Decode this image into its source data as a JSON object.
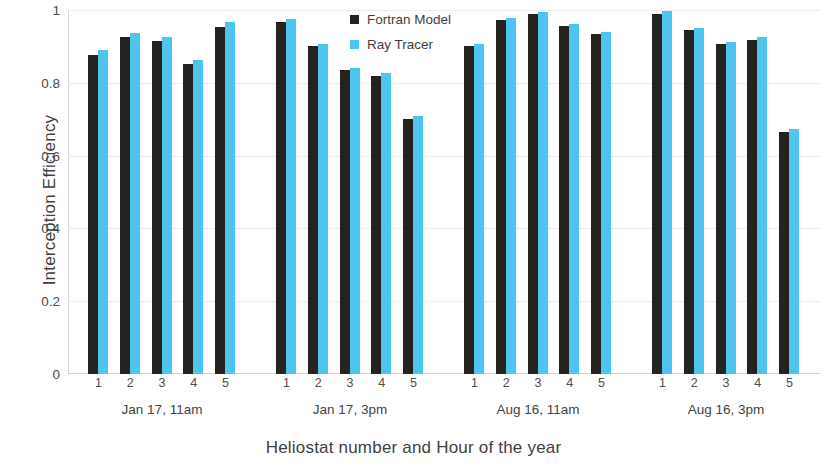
{
  "chart_data": {
    "type": "bar",
    "title": "",
    "xlabel": "Heliostat number and Hour of the year",
    "ylabel": "Interception Efficiency",
    "ylim": [
      0,
      1
    ],
    "yticks": [
      "0",
      "0.2",
      "0.4",
      "0.6",
      "0.8",
      "1"
    ],
    "ytick_values": [
      0,
      0.2,
      0.4,
      0.6,
      0.8,
      1
    ],
    "grid": true,
    "legend_position": "top-center",
    "colors": {
      "fortran_model": "#262220",
      "ray_tracer": "#4ec5ee",
      "gridline": "#ececec",
      "axis": "#d0d0d0",
      "text": "#3f3f3f"
    },
    "categories": [
      "1",
      "2",
      "3",
      "4",
      "5"
    ],
    "groups": [
      {
        "label": "Jan 17, 11am",
        "categories": [
          "1",
          "2",
          "3",
          "4",
          "5"
        ],
        "series": [
          {
            "name": "Fortran Model",
            "values": [
              0.877,
              0.925,
              0.915,
              0.851,
              0.952
            ]
          },
          {
            "name": "Ray Tracer",
            "values": [
              0.89,
              0.936,
              0.926,
              0.864,
              0.966
            ]
          }
        ]
      },
      {
        "label": "Jan 17, 3pm",
        "categories": [
          "1",
          "2",
          "3",
          "4",
          "5"
        ],
        "series": [
          {
            "name": "Fortran Model",
            "values": [
              0.968,
              0.902,
              0.835,
              0.818,
              0.7
            ]
          },
          {
            "name": "Ray Tracer",
            "values": [
              0.975,
              0.908,
              0.84,
              0.826,
              0.71
            ]
          }
        ]
      },
      {
        "label": "Aug 16, 11am",
        "categories": [
          "1",
          "2",
          "3",
          "4",
          "5"
        ],
        "series": [
          {
            "name": "Fortran Model",
            "values": [
              0.9,
              0.973,
              0.99,
              0.957,
              0.933
            ]
          },
          {
            "name": "Ray Tracer",
            "values": [
              0.908,
              0.978,
              0.995,
              0.961,
              0.94
            ]
          }
        ]
      },
      {
        "label": "Aug 16, 3pm",
        "categories": [
          "1",
          "2",
          "3",
          "4",
          "5"
        ],
        "series": [
          {
            "name": "Fortran Model",
            "values": [
              0.99,
              0.944,
              0.908,
              0.918,
              0.665
            ]
          },
          {
            "name": "Ray Tracer",
            "values": [
              0.996,
              0.951,
              0.913,
              0.925,
              0.672
            ]
          }
        ]
      }
    ],
    "legend": [
      {
        "label": "Fortran Model",
        "color": "#262220"
      },
      {
        "label": "Ray Tracer",
        "color": "#4ec5ee"
      }
    ]
  }
}
